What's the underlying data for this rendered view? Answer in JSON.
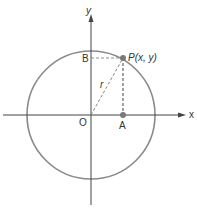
{
  "diagram": {
    "axes": {
      "x_label": "x",
      "y_label": "y",
      "origin_label": "O"
    },
    "points": {
      "P": "P(x, y)",
      "A": "A",
      "B": "B"
    },
    "radius_label": "r",
    "colors": {
      "circle": "#8a8a8a",
      "axes": "#444444",
      "dashed": "#8a8a8a",
      "point": "#7a7a7a"
    }
  }
}
